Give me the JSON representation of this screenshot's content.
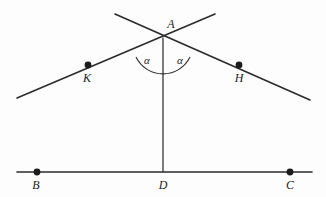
{
  "figure": {
    "background_color": "#fdfdfd",
    "stroke_color": "#2b2b2b",
    "point_color": "#1c1c1c",
    "width": 326,
    "height": 197
  },
  "points": {
    "A": {
      "label": "A",
      "x": 163,
      "y": 38,
      "label_x": 171,
      "label_y": 28,
      "marker": false
    },
    "K": {
      "label": "K",
      "x": 88,
      "y": 65,
      "label_x": 87,
      "label_y": 82,
      "marker": true
    },
    "H": {
      "label": "H",
      "x": 239,
      "y": 65,
      "label_x": 239,
      "label_y": 82,
      "marker": true
    },
    "B": {
      "label": "B",
      "x": 37,
      "y": 172,
      "label_x": 36,
      "label_y": 189,
      "marker": true
    },
    "D": {
      "label": "D",
      "x": 163,
      "y": 172,
      "label_x": 163,
      "label_y": 189,
      "marker": false
    },
    "C": {
      "label": "C",
      "x": 290,
      "y": 172,
      "label_x": 290,
      "label_y": 189,
      "marker": true
    }
  },
  "angles": [
    {
      "label": "α",
      "name": "angle-alpha-left",
      "label_x": 147,
      "label_y": 64
    },
    {
      "label": "α",
      "name": "angle-alpha-right",
      "label_x": 180,
      "label_y": 64
    }
  ],
  "segments": {
    "ray_left": {
      "name": "ray-through-K",
      "x1": 17,
      "y1": 98,
      "x2": 215,
      "y2": 14
    },
    "ray_right": {
      "name": "ray-through-H",
      "x1": 115,
      "y1": 14,
      "x2": 310,
      "y2": 100
    },
    "altitude": {
      "name": "segment-AD",
      "x1": 163,
      "y1": 38,
      "x2": 163,
      "y2": 172
    },
    "baseline": {
      "name": "segment-BC",
      "x1": 17,
      "y1": 172,
      "x2": 312,
      "y2": 172
    }
  },
  "arc": {
    "name": "angle-arc-at-A",
    "path": "M 136 57 A 30 30 0 0 0 190 57",
    "radius": 30
  }
}
